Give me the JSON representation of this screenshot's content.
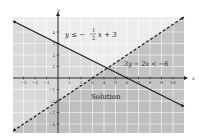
{
  "chart_data": {
    "type": "line",
    "xlabel": "x",
    "ylabel": "y",
    "xlim": [
      -3.7,
      11
    ],
    "ylim": [
      -4.7,
      5.3
    ],
    "x_ticks": [
      -3,
      -2,
      -1,
      1,
      2,
      3,
      4,
      5,
      6,
      7,
      8,
      9,
      10
    ],
    "y_ticks": [
      -4,
      -3,
      -2,
      -1,
      1,
      2,
      3,
      4
    ],
    "grid": true,
    "series": [
      {
        "name": "y ≤ -1/2 x + 3",
        "boundary": "y = -0.5x + 3",
        "style": "solid",
        "shade": "below",
        "points": [
          [
            -3.7,
            4.85
          ],
          [
            11,
            -2.5
          ]
        ]
      },
      {
        "name": "3y - 2x < -6",
        "boundary": "y = (2/3)x - 2",
        "style": "dashed",
        "shade": "below",
        "points": [
          [
            -3.7,
            -4.47
          ],
          [
            11,
            5.33
          ]
        ]
      }
    ],
    "annotations": [
      {
        "text": "y ≤ −1/2 x + 3",
        "x": 1.3,
        "y": 4
      },
      {
        "text": "3y − 2x < −6",
        "x": 6,
        "y": 1
      },
      {
        "text": "Solution",
        "x": 5,
        "y": -1.5
      }
    ]
  },
  "labels": {
    "eq1_lhs": "y ≤ −",
    "eq1_num": "1",
    "eq1_den": "2",
    "eq1_rhs": "x + 3",
    "eq2": "3y − 2x < −6",
    "solution": "Solution",
    "x_axis": "x",
    "y_axis": "y"
  }
}
